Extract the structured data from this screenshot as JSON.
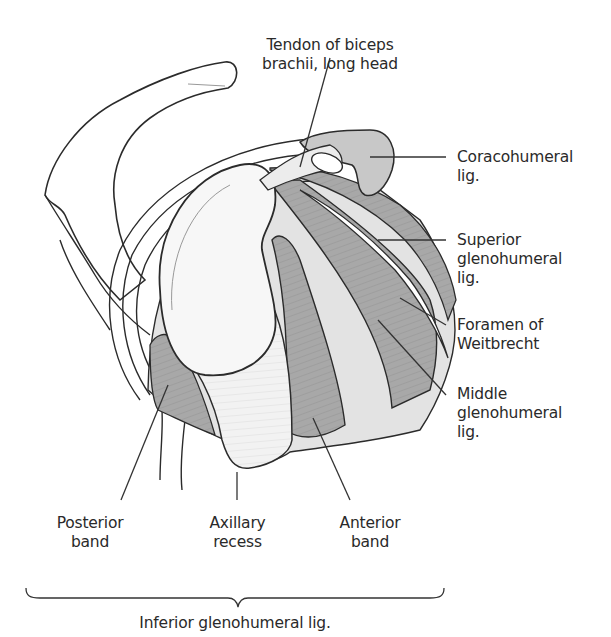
{
  "figure": {
    "colors": {
      "ligament": "#a9a9a9",
      "ligament_dark": "#8e8e8e",
      "bone_fill": "#f5f5f5",
      "capsule_fill": "#e4e4e4",
      "outline": "#2b2b2b",
      "leader": "#333333",
      "background": "#ffffff"
    },
    "labels": {
      "biceps_tendon": {
        "line1": "Tendon of biceps",
        "line2": "brachii, long head"
      },
      "coracohumeral": {
        "line1": "Coracohumeral",
        "line2": "lig."
      },
      "superior_gh": {
        "line1": "Superior",
        "line2": "glenohumeral",
        "line3": "lig."
      },
      "foramen": {
        "line1": "Foramen of",
        "line2": "Weitbrecht"
      },
      "middle_gh": {
        "line1": "Middle",
        "line2": "glenohumeral",
        "line3": "lig."
      },
      "posterior_band": {
        "line1": "Posterior",
        "line2": "band"
      },
      "axillary_recess": {
        "line1": "Axillary",
        "line2": "recess"
      },
      "anterior_band": {
        "line1": "Anterior",
        "line2": "band"
      },
      "inferior_gh": {
        "line1": "Inferior glenohumeral lig."
      }
    }
  }
}
